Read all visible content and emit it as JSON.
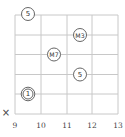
{
  "diagram": {
    "type": "guitar-chord-fretboard",
    "orientation": "horizontal",
    "colors": {
      "grid": "#c8c8c8",
      "marker_stroke": "#555555",
      "text": "#333333",
      "background": "#ffffff"
    },
    "frets": {
      "labels": [
        "9",
        "10",
        "11",
        "12",
        "13"
      ]
    },
    "strings_count": 6,
    "markers": [
      {
        "label": "5",
        "string": 1,
        "fret_between": "9-10",
        "style": "circle"
      },
      {
        "label": "M3",
        "string": 2,
        "fret_between": "11-12",
        "style": "circle"
      },
      {
        "label": "M7",
        "string": 3,
        "fret_between": "10-11",
        "style": "circle"
      },
      {
        "label": "5",
        "string": 4,
        "fret_between": "11-12",
        "style": "circle"
      },
      {
        "label": "1",
        "string": 5,
        "fret_between": "9-10",
        "style": "double-circle"
      }
    ],
    "muted": [
      {
        "label": "×",
        "string": 6
      }
    ]
  }
}
